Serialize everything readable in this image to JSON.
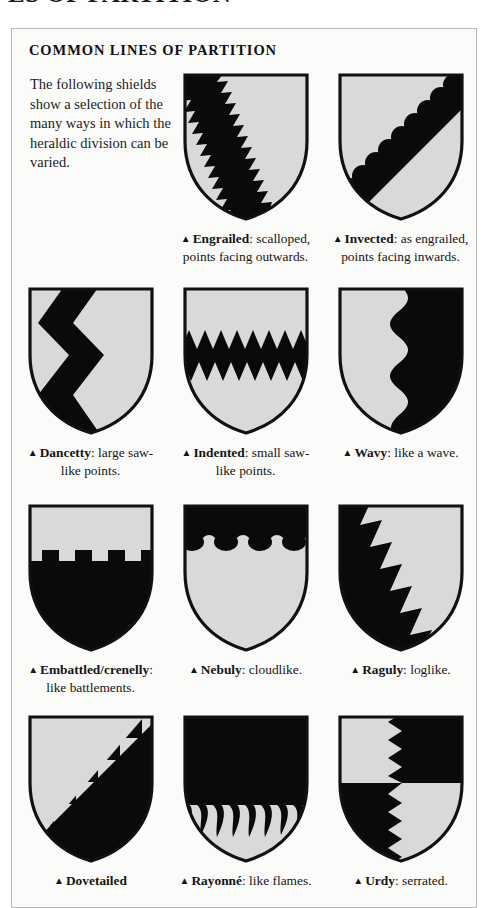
{
  "page_heading": "ES OF PARTITION",
  "panel": {
    "title": "COMMON LINES OF PARTITION",
    "intro": "The following shields show a selection of the many ways in which the heraldic division can be varied.",
    "bullet": "▲"
  },
  "colors": {
    "panel_background": "#fbfbfa",
    "panel_border": "#b9b9b7",
    "shield_field": "#d9d9d9",
    "shield_charge": "#0a0a0a",
    "shield_outline": "#111111",
    "text": "#151515"
  },
  "shields": [
    {
      "id": "engrailed",
      "term": "Engrailed",
      "description": ": scalloped, points facing outwards.",
      "pattern": "engrailed-bend"
    },
    {
      "id": "invected",
      "term": "Invected",
      "description": ": as engrailed, points facing inwards.",
      "pattern": "invected-bend"
    },
    {
      "id": "dancetty",
      "term": "Dancetty",
      "description": ": large saw-like points.",
      "pattern": "dancetty-pale"
    },
    {
      "id": "indented",
      "term": "Indented",
      "description": ": small saw-like points.",
      "pattern": "indented-fess"
    },
    {
      "id": "wavy",
      "term": "Wavy",
      "description": ": like a wave.",
      "pattern": "wavy-pale"
    },
    {
      "id": "embattled",
      "term": "Embattled/crenelly",
      "description": ": like battlements.",
      "pattern": "embattled-fess"
    },
    {
      "id": "nebuly",
      "term": "Nebuly",
      "description": ": cloudlike.",
      "pattern": "nebuly-chief"
    },
    {
      "id": "raguly",
      "term": "Raguly",
      "description": ": loglike.",
      "pattern": "raguly-bend"
    },
    {
      "id": "dovetailed",
      "term": "Dovetailed",
      "description": "",
      "pattern": "dovetailed-bend"
    },
    {
      "id": "rayonne",
      "term": "Rayonné",
      "description": ": like flames.",
      "pattern": "rayonne-fess"
    },
    {
      "id": "urdy",
      "term": "Urdy",
      "description": ": serrated.",
      "pattern": "urdy-quarterly"
    }
  ]
}
